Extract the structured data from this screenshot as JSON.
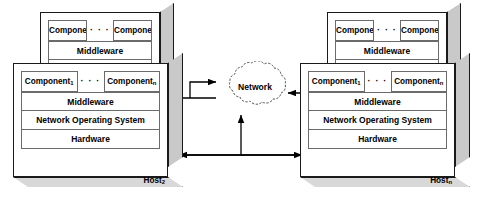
{
  "diagram": {
    "layer_labels": {
      "middleware": "Middleware",
      "nos": "Network Operating System",
      "hardware": "Hardware"
    },
    "component_first": "Component",
    "component_first_sub": "1",
    "component_last": "Component",
    "component_last_sub": "n",
    "ellipsis": "· · ·",
    "network": {
      "label": "Network",
      "shape": "cloud"
    },
    "hosts": [
      {
        "id": "host-1",
        "label": "Host",
        "sub": "1",
        "position": "back-left",
        "layers": [
          "Component₁ ··· Componentₙ",
          "Middleware",
          "Network Operating System",
          "Hardware"
        ]
      },
      {
        "id": "host-2",
        "label": "Host",
        "sub": "2",
        "position": "front-left",
        "layers": [
          "Component₁ ··· Componentₙ",
          "Middleware",
          "Network Operating System",
          "Hardware"
        ]
      },
      {
        "id": "host-n-1",
        "label": "Host",
        "sub": "n-1",
        "position": "back-right",
        "layers": [
          "Component₁ ··· Componentₙ",
          "Middleware",
          "Network Operating System",
          "Hardware"
        ]
      },
      {
        "id": "host-n",
        "label": "Host",
        "sub": "n",
        "position": "front-right",
        "layers": [
          "Component₁ ··· Componentₙ",
          "Middleware",
          "Network Operating System",
          "Hardware"
        ]
      }
    ],
    "connections": [
      {
        "from": "host-1",
        "to": "network",
        "style": "bidirectional-elbow"
      },
      {
        "from": "host-n-1",
        "to": "network",
        "style": "arrow-left"
      },
      {
        "from": "host-2",
        "to": "network",
        "style": "bus-arrow"
      },
      {
        "from": "host-n",
        "to": "network",
        "style": "bus-arrow"
      }
    ],
    "colors": {
      "line": "#1a1a1a",
      "inner_line": "#6b6b6b",
      "side_fill": "#c9c9c9",
      "bottom_fill": "#d8d8d8",
      "background": "#ffffff"
    }
  }
}
